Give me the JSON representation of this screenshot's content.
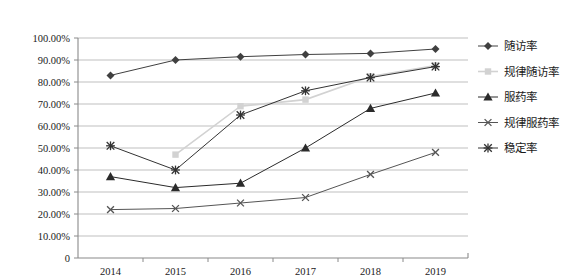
{
  "chart_data": {
    "type": "line",
    "title": "",
    "xlabel": "",
    "ylabel": "",
    "categories": [
      "2014",
      "2015",
      "2016",
      "2017",
      "2018",
      "2019"
    ],
    "ylim": [
      0,
      100
    ],
    "ytick_labels": [
      "0",
      "10.00%",
      "20.00%",
      "30.00%",
      "40.00%",
      "50.00%",
      "60.00%",
      "70.00%",
      "80.00%",
      "90.00%",
      "100.00%"
    ],
    "ytick_values": [
      0,
      10,
      20,
      30,
      40,
      50,
      60,
      70,
      80,
      90,
      100
    ],
    "grid": true,
    "legend_position": "right",
    "series": [
      {
        "name": "随访率",
        "marker": "diamond",
        "color": "#404040",
        "values": [
          83.0,
          90.0,
          91.5,
          92.5,
          93.0,
          95.0
        ]
      },
      {
        "name": "规律随访率",
        "marker": "square",
        "color": "#d2d2d2",
        "values": [
          null,
          47.0,
          69.0,
          72.0,
          82.5,
          87.5
        ]
      },
      {
        "name": "服药率",
        "marker": "triangle",
        "color": "#2b2b2b",
        "values": [
          37.0,
          32.0,
          34.0,
          50.0,
          68.0,
          75.0
        ]
      },
      {
        "name": "规律服药率",
        "marker": "x",
        "color": "#555555",
        "values": [
          22.0,
          22.5,
          25.0,
          27.5,
          38.0,
          48.0
        ]
      },
      {
        "name": "稳定率",
        "marker": "asterisk",
        "color": "#333333",
        "values": [
          51.0,
          40.0,
          65.0,
          76.0,
          82.0,
          87.0
        ]
      }
    ]
  },
  "axis": {
    "axis_color": "#8a8a8a",
    "grid_color": "#b8b8b8"
  }
}
